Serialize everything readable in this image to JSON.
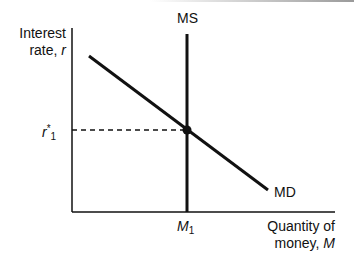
{
  "diagram": {
    "y_axis": {
      "label_line1": "Interest",
      "label_line2_text": "rate, ",
      "label_line2_var": "r"
    },
    "x_axis": {
      "label_line1": "Quantity of",
      "label_line2_text": "money, ",
      "label_line2_var": "M"
    },
    "curves": [
      {
        "name": "MS",
        "label": "MS",
        "type": "vertical supply"
      },
      {
        "name": "MD",
        "label": "MD",
        "type": "downward-sloping demand"
      }
    ],
    "equilibrium": {
      "rate_label_base": "r",
      "rate_label_sup": "*",
      "rate_label_sub": "1",
      "quantity_label_base": "M",
      "quantity_label_sub": "1"
    },
    "colors": {
      "line": "#111111",
      "background": "#ffffff"
    }
  }
}
